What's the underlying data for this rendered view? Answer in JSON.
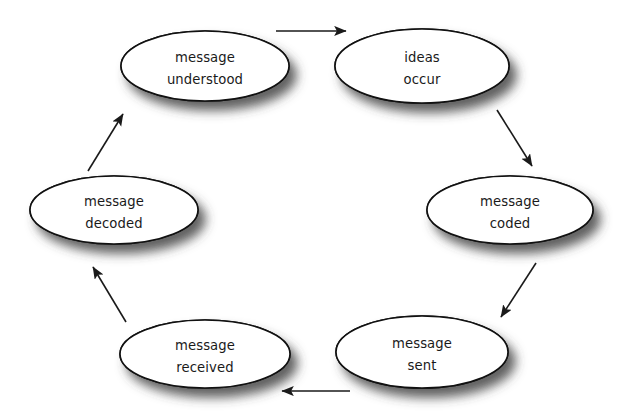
{
  "diagram": {
    "background_color": "#ffffff",
    "node_fill": "#ffffff",
    "node_stroke": "#111111",
    "text_color": "#1a1a1a",
    "arrow_color": "#1a1a1a",
    "shadow_color": "#4d4d4d",
    "nodes": [
      {
        "id": "ideas-occur",
        "line1": "ideas",
        "line2": "occur",
        "cx": 422,
        "cy": 66,
        "rx": 87,
        "ry": 37,
        "position": "top-right"
      },
      {
        "id": "message-coded",
        "line1": "message",
        "line2": "coded",
        "cx": 510,
        "cy": 210,
        "rx": 83,
        "ry": 34,
        "position": "right"
      },
      {
        "id": "message-sent",
        "line1": "message",
        "line2": "sent",
        "cx": 422,
        "cy": 352,
        "rx": 86,
        "ry": 36,
        "position": "bottom-right"
      },
      {
        "id": "message-received",
        "line1": "message",
        "line2": "received",
        "cx": 205,
        "cy": 354,
        "rx": 85,
        "ry": 34,
        "position": "bottom-left"
      },
      {
        "id": "message-decoded",
        "line1": "message",
        "line2": "decoded",
        "cx": 114,
        "cy": 210,
        "rx": 84,
        "ry": 34,
        "position": "left"
      },
      {
        "id": "message-understood",
        "line1": "message",
        "line2": "understood",
        "cx": 205,
        "cy": 66,
        "rx": 84,
        "ry": 35,
        "position": "top-left"
      }
    ],
    "arrows": [
      {
        "id": "arrow-understood-to-ideas",
        "from": "message-understood",
        "to": "ideas-occur",
        "x1": 276,
        "y1": 31,
        "x2": 348,
        "y2": 31,
        "direction": "right"
      },
      {
        "id": "arrow-ideas-to-coded",
        "from": "ideas-occur",
        "to": "message-coded",
        "x1": 497,
        "y1": 110,
        "x2": 534,
        "y2": 168,
        "direction": "down-right"
      },
      {
        "id": "arrow-coded-to-sent",
        "from": "message-coded",
        "to": "message-sent",
        "x1": 536,
        "y1": 263,
        "x2": 499,
        "y2": 319,
        "direction": "down-left"
      },
      {
        "id": "arrow-sent-to-received",
        "from": "message-sent",
        "to": "message-received",
        "x1": 350,
        "y1": 391,
        "x2": 280,
        "y2": 391,
        "direction": "left"
      },
      {
        "id": "arrow-received-to-decoded",
        "from": "message-received",
        "to": "message-decoded",
        "x1": 126,
        "y1": 322,
        "x2": 91,
        "y2": 265,
        "direction": "up-left"
      },
      {
        "id": "arrow-decoded-to-understood",
        "from": "message-decoded",
        "to": "message-understood",
        "x1": 88,
        "y1": 171,
        "x2": 125,
        "y2": 112,
        "direction": "up-right"
      }
    ]
  }
}
